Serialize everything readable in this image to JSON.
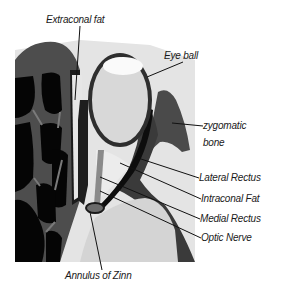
{
  "diagram": {
    "colors": {
      "background": "#ffffff",
      "bone_dark": "#4a4a4a",
      "cavity_black": "#050505",
      "fat_light": "#dcdcdc",
      "eyeball_fill": "#d9d9d9",
      "eyeball_highlight": "#f8f8f8",
      "muscle_dark": "#2a2a2a",
      "nerve_gray": "#8a8a8a",
      "label_text": "#1a1a1a"
    },
    "labels": {
      "extraconal_fat": "Extraconal fat",
      "eye_ball": "Eye ball",
      "zygomatic_line1": "zygomatic",
      "zygomatic_line2": "bone",
      "lateral_rectus": "Lateral Rectus",
      "intraconal_fat": "Intraconal Fat",
      "medial_rectus": "Medial Rectus",
      "optic_nerve": "Optic Nerve",
      "annulus_of_zinn": "Annulus of Zinn"
    }
  }
}
